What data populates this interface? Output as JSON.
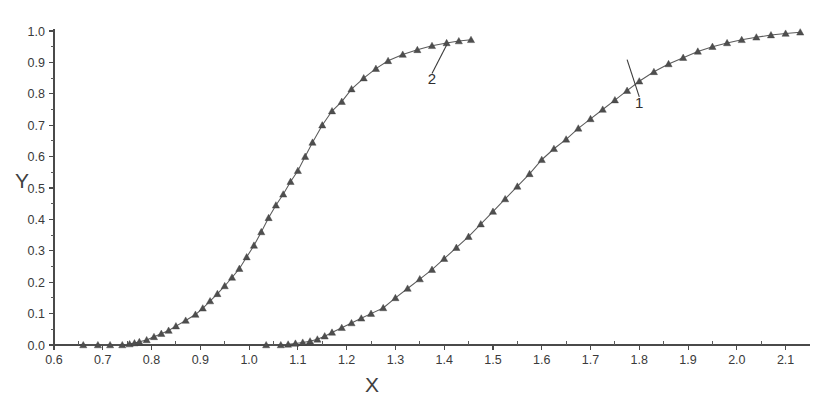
{
  "chart_data": {
    "type": "line",
    "title": "",
    "subtitle": "",
    "xlabel": "X",
    "ylabel": "Y",
    "xlim": [
      0.6,
      2.15
    ],
    "ylim": [
      0.0,
      1.0
    ],
    "grid": false,
    "legend_position": "inline-annotation",
    "x_ticks": [
      0.6,
      0.7,
      0.8,
      0.9,
      1.0,
      1.1,
      1.2,
      1.3,
      1.4,
      1.5,
      1.6,
      1.7,
      1.8,
      1.9,
      2.0,
      2.1
    ],
    "x_tick_labels": [
      "0.6",
      "0.7",
      "0.8",
      "0.9",
      "1.0",
      "1.1",
      "1.2",
      "1.3",
      "1.4",
      "1.5",
      "1.6",
      "1.7",
      "1.8",
      "1.9",
      "2.0",
      "2.1"
    ],
    "x_minor_tick_step": 0.05,
    "y_ticks": [
      0.0,
      0.1,
      0.2,
      0.3,
      0.4,
      0.5,
      0.6,
      0.7,
      0.8,
      0.9,
      1.0
    ],
    "y_tick_labels": [
      "0.0",
      "0.1",
      "0.2",
      "0.3",
      "0.4",
      "0.5",
      "0.6",
      "0.7",
      "0.8",
      "0.9",
      "1.0"
    ],
    "y_minor_tick_step": 0.05,
    "marker": "triangle",
    "line_color": "#5b5b5b",
    "marker_color": "#4e4e4e",
    "series": [
      {
        "name": "2",
        "label": "2",
        "annotation_label": "2",
        "x": [
          0.66,
          0.69,
          0.715,
          0.74,
          0.755,
          0.765,
          0.775,
          0.79,
          0.805,
          0.82,
          0.835,
          0.85,
          0.87,
          0.89,
          0.905,
          0.92,
          0.935,
          0.95,
          0.965,
          0.98,
          0.995,
          1.01,
          1.025,
          1.04,
          1.055,
          1.07,
          1.085,
          1.1,
          1.115,
          1.13,
          1.15,
          1.17,
          1.19,
          1.21,
          1.235,
          1.26,
          1.285,
          1.315,
          1.345,
          1.375,
          1.405,
          1.43,
          1.455
        ],
        "y": [
          0.0,
          0.0,
          0.0,
          0.0,
          0.003,
          0.006,
          0.01,
          0.016,
          0.026,
          0.036,
          0.046,
          0.06,
          0.078,
          0.097,
          0.117,
          0.14,
          0.163,
          0.188,
          0.215,
          0.243,
          0.28,
          0.317,
          0.36,
          0.405,
          0.445,
          0.48,
          0.52,
          0.555,
          0.6,
          0.645,
          0.7,
          0.745,
          0.775,
          0.815,
          0.85,
          0.88,
          0.905,
          0.925,
          0.94,
          0.953,
          0.962,
          0.968,
          0.972
        ]
      },
      {
        "name": "1",
        "label": "1",
        "annotation_label": "1",
        "x": [
          1.035,
          1.065,
          1.08,
          1.095,
          1.11,
          1.125,
          1.14,
          1.155,
          1.17,
          1.19,
          1.21,
          1.23,
          1.25,
          1.275,
          1.3,
          1.325,
          1.35,
          1.375,
          1.4,
          1.425,
          1.45,
          1.475,
          1.5,
          1.525,
          1.55,
          1.575,
          1.6,
          1.625,
          1.65,
          1.675,
          1.7,
          1.725,
          1.75,
          1.775,
          1.8,
          1.83,
          1.86,
          1.89,
          1.92,
          1.95,
          1.98,
          2.01,
          2.04,
          2.07,
          2.1,
          2.13
        ],
        "y": [
          0.0,
          0.0,
          0.002,
          0.005,
          0.008,
          0.012,
          0.018,
          0.028,
          0.04,
          0.055,
          0.07,
          0.085,
          0.1,
          0.118,
          0.15,
          0.18,
          0.21,
          0.24,
          0.275,
          0.31,
          0.345,
          0.385,
          0.425,
          0.465,
          0.505,
          0.545,
          0.59,
          0.625,
          0.655,
          0.69,
          0.72,
          0.75,
          0.78,
          0.81,
          0.84,
          0.87,
          0.895,
          0.915,
          0.935,
          0.95,
          0.962,
          0.972,
          0.98,
          0.987,
          0.992,
          0.996
        ]
      }
    ],
    "annotations": [
      {
        "text": "2",
        "points_to_series": "2",
        "anchor_x": 1.405,
        "anchor_y": 0.962,
        "text_x": 1.375,
        "text_y": 0.83
      },
      {
        "text": "1",
        "points_to_series": "1",
        "anchor_x": 1.775,
        "anchor_y": 0.915,
        "text_x": 1.8,
        "text_y": 0.755
      }
    ]
  },
  "axes": {
    "x_title": "X",
    "y_title": "Y"
  }
}
